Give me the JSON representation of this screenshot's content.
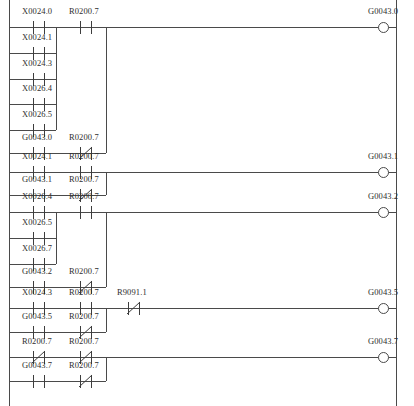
{
  "diagram": {
    "type": "ladder-logic",
    "rails": {
      "left_x": 9,
      "right_x": 396
    },
    "columns": {
      "col1_x": 33,
      "col2_x": 80,
      "col3_x": 128
    },
    "rungs": [
      {
        "id": "rung-1",
        "output": {
          "name": "G0043.0",
          "x": 383,
          "y": 27
        },
        "branches": [
          {
            "contacts": [
              {
                "name": "X0024.0",
                "type": "NO",
                "x": 33,
                "y": 21
              },
              {
                "name": "R0200.7",
                "type": "NO",
                "x": 80,
                "y": 21
              }
            ]
          },
          {
            "contacts": [
              {
                "name": "X0024.1",
                "type": "NO",
                "x": 33,
                "y": 47
              }
            ]
          },
          {
            "contacts": [
              {
                "name": "X0024.3",
                "type": "NO",
                "x": 33,
                "y": 73
              }
            ]
          },
          {
            "contacts": [
              {
                "name": "X0026.4",
                "type": "NO",
                "x": 33,
                "y": 98
              }
            ]
          },
          {
            "contacts": [
              {
                "name": "X0026.5",
                "type": "NO",
                "x": 33,
                "y": 124
              }
            ]
          },
          {
            "contacts": [
              {
                "name": "G0043.0",
                "type": "NO",
                "x": 33,
                "y": 147
              },
              {
                "name": "R0200.7",
                "type": "NC",
                "x": 80,
                "y": 147
              }
            ]
          }
        ]
      },
      {
        "id": "rung-2",
        "output": {
          "name": "G0043.1",
          "x": 383,
          "y": 172
        },
        "branches": [
          {
            "contacts": [
              {
                "name": "X0024.1",
                "type": "NO",
                "x": 33,
                "y": 166
              },
              {
                "name": "R0200.7",
                "type": "NO",
                "x": 80,
                "y": 166
              }
            ]
          },
          {
            "contacts": [
              {
                "name": "G0043.1",
                "type": "NO",
                "x": 33,
                "y": 189
              },
              {
                "name": "R0200.7",
                "type": "NC",
                "x": 80,
                "y": 189
              }
            ]
          }
        ]
      },
      {
        "id": "rung-3",
        "output": {
          "name": "G0043.2",
          "x": 383,
          "y": 212
        },
        "branches": [
          {
            "contacts": [
              {
                "name": "X0026.4",
                "type": "NO",
                "x": 33,
                "y": 206
              },
              {
                "name": "R0200.7",
                "type": "NO",
                "x": 80,
                "y": 206
              }
            ]
          },
          {
            "contacts": [
              {
                "name": "X0026.5",
                "type": "NO",
                "x": 33,
                "y": 232
              }
            ]
          },
          {
            "contacts": [
              {
                "name": "X0026.7",
                "type": "NO",
                "x": 33,
                "y": 258
              }
            ]
          },
          {
            "contacts": [
              {
                "name": "G0043.2",
                "type": "NO",
                "x": 33,
                "y": 281
              },
              {
                "name": "R0200.7",
                "type": "NC",
                "x": 80,
                "y": 281
              }
            ]
          }
        ]
      },
      {
        "id": "rung-4",
        "output": {
          "name": "G0043.5",
          "x": 383,
          "y": 308
        },
        "branches": [
          {
            "contacts": [
              {
                "name": "X0024.3",
                "type": "NO",
                "x": 33,
                "y": 302
              },
              {
                "name": "R0200.7",
                "type": "NO",
                "x": 80,
                "y": 302
              },
              {
                "name": "R9091.1",
                "type": "NC",
                "x": 128,
                "y": 302
              }
            ]
          },
          {
            "contacts": [
              {
                "name": "G0043.5",
                "type": "NO",
                "x": 33,
                "y": 326
              },
              {
                "name": "R0200.7",
                "type": "NC",
                "x": 80,
                "y": 326
              }
            ]
          }
        ]
      },
      {
        "id": "rung-5",
        "output": {
          "name": "G0043.7",
          "x": 383,
          "y": 357
        },
        "branches": [
          {
            "contacts": [
              {
                "name": "R0200.7",
                "type": "NC",
                "x": 33,
                "y": 351
              },
              {
                "name": "R0200.7",
                "type": "NC",
                "x": 80,
                "y": 351
              }
            ]
          },
          {
            "contacts": [
              {
                "name": "G0043.7",
                "type": "NO",
                "x": 33,
                "y": 375
              },
              {
                "name": "R0200.7",
                "type": "NC",
                "x": 80,
                "y": 375
              }
            ]
          }
        ]
      }
    ],
    "labels": [
      {
        "text": "X0024.0",
        "x": 22,
        "y": 6
      },
      {
        "text": "R0200.7",
        "x": 69,
        "y": 6
      },
      {
        "text": "G0043.0",
        "x": 368,
        "y": 6
      },
      {
        "text": "X0024.1",
        "x": 22,
        "y": 32
      },
      {
        "text": "X0024.3",
        "x": 22,
        "y": 58
      },
      {
        "text": "X0026.4",
        "x": 22,
        "y": 83
      },
      {
        "text": "X0026.5",
        "x": 22,
        "y": 109
      },
      {
        "text": "G0043.0",
        "x": 22,
        "y": 132
      },
      {
        "text": "R0200.7",
        "x": 69,
        "y": 132
      },
      {
        "text": "X0024.1",
        "x": 22,
        "y": 151
      },
      {
        "text": "R0200.7",
        "x": 69,
        "y": 151
      },
      {
        "text": "G0043.1",
        "x": 368,
        "y": 151
      },
      {
        "text": "G0043.1",
        "x": 22,
        "y": 174
      },
      {
        "text": "R0200.7",
        "x": 69,
        "y": 174
      },
      {
        "text": "X0026.4",
        "x": 22,
        "y": 191
      },
      {
        "text": "R0200.7",
        "x": 69,
        "y": 191
      },
      {
        "text": "G0043.2",
        "x": 368,
        "y": 191
      },
      {
        "text": "X0026.5",
        "x": 22,
        "y": 217
      },
      {
        "text": "X0026.7",
        "x": 22,
        "y": 243
      },
      {
        "text": "G0043.2",
        "x": 22,
        "y": 266
      },
      {
        "text": "R0200.7",
        "x": 69,
        "y": 266
      },
      {
        "text": "X0024.3",
        "x": 22,
        "y": 287
      },
      {
        "text": "R0200.7",
        "x": 69,
        "y": 287
      },
      {
        "text": "R9091.1",
        "x": 117,
        "y": 287
      },
      {
        "text": "G0043.5",
        "x": 368,
        "y": 287
      },
      {
        "text": "G0043.5",
        "x": 22,
        "y": 311
      },
      {
        "text": "R0200.7",
        "x": 69,
        "y": 311
      },
      {
        "text": "R0200.7",
        "x": 22,
        "y": 336
      },
      {
        "text": "R0200.7",
        "x": 69,
        "y": 336
      },
      {
        "text": "G0043.7",
        "x": 368,
        "y": 336
      },
      {
        "text": "G0043.7",
        "x": 22,
        "y": 360
      },
      {
        "text": "R0200.7",
        "x": 69,
        "y": 360
      }
    ],
    "wires": {
      "horizontal": [
        {
          "name": "rung1-main",
          "x": 9,
          "y": 27,
          "w": 387
        },
        {
          "name": "rung1-br2",
          "x": 9,
          "y": 53,
          "w": 47
        },
        {
          "name": "rung1-br3",
          "x": 9,
          "y": 79,
          "w": 47
        },
        {
          "name": "rung1-br4",
          "x": 9,
          "y": 104,
          "w": 47
        },
        {
          "name": "rung1-br5",
          "x": 9,
          "y": 130,
          "w": 47
        },
        {
          "name": "rung1-seal",
          "x": 9,
          "y": 153,
          "w": 97
        },
        {
          "name": "rung2-main",
          "x": 9,
          "y": 172,
          "w": 387
        },
        {
          "name": "rung2-seal",
          "x": 9,
          "y": 195,
          "w": 97
        },
        {
          "name": "rung3-main",
          "x": 9,
          "y": 212,
          "w": 387
        },
        {
          "name": "rung3-br2",
          "x": 9,
          "y": 238,
          "w": 47
        },
        {
          "name": "rung3-br3",
          "x": 9,
          "y": 264,
          "w": 47
        },
        {
          "name": "rung3-seal",
          "x": 9,
          "y": 287,
          "w": 97
        },
        {
          "name": "rung4-main",
          "x": 9,
          "y": 308,
          "w": 387
        },
        {
          "name": "rung4-seal",
          "x": 9,
          "y": 332,
          "w": 97
        },
        {
          "name": "rung5-main",
          "x": 9,
          "y": 357,
          "w": 387
        },
        {
          "name": "rung5-seal",
          "x": 9,
          "y": 381,
          "w": 97
        }
      ],
      "vertical": [
        {
          "name": "left-rail",
          "x": 9,
          "y": 0,
          "h": 406
        },
        {
          "name": "right-rail",
          "x": 396,
          "y": 0,
          "h": 406
        },
        {
          "name": "rung1-branch-tie",
          "x": 56,
          "y": 27,
          "h": 103
        },
        {
          "name": "rung1-seal-tie",
          "x": 106,
          "y": 27,
          "h": 126
        },
        {
          "name": "rung2-seal-tie",
          "x": 106,
          "y": 172,
          "h": 23
        },
        {
          "name": "rung3-branch-tie",
          "x": 56,
          "y": 212,
          "h": 52
        },
        {
          "name": "rung3-seal-tie",
          "x": 106,
          "y": 212,
          "h": 75
        },
        {
          "name": "rung4-seal-tie",
          "x": 106,
          "y": 308,
          "h": 24
        },
        {
          "name": "rung5-seal-tie",
          "x": 106,
          "y": 357,
          "h": 24
        }
      ]
    }
  }
}
